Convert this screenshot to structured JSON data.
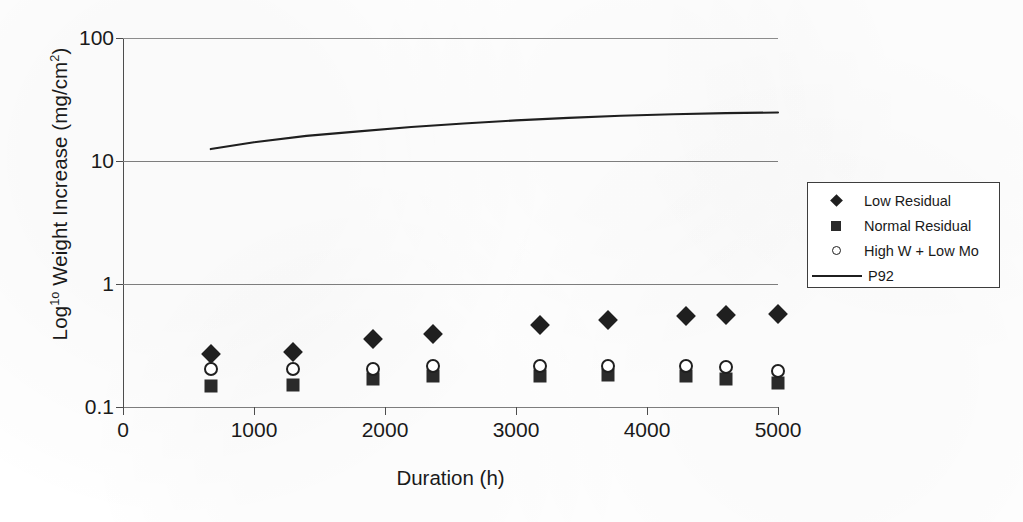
{
  "chart_data": {
    "type": "scatter",
    "title": "",
    "xlabel": "Duration (h)",
    "ylabel": "Log¹° Weight Increase (mg/cm²)",
    "xlim": [
      0,
      5000
    ],
    "ylim": [
      0.1,
      100
    ],
    "yscale": "log",
    "grid": true,
    "legend_position": "right-outside",
    "xticks": [
      "0",
      "1000",
      "2000",
      "3000",
      "4000",
      "5000"
    ],
    "xtick_values": [
      0,
      1000,
      2000,
      3000,
      4000,
      5000
    ],
    "yticks": [
      "0.1",
      "1",
      "10",
      "100"
    ],
    "ytick_values": [
      0.1,
      1,
      10,
      100
    ],
    "series": [
      {
        "name": "Low Residual",
        "marker": "filled-diamond",
        "color": "#1f1f1f",
        "x": [
          670,
          1300,
          1910,
          2370,
          3180,
          3700,
          4300,
          4600,
          5000
        ],
        "y": [
          0.27,
          0.28,
          0.36,
          0.39,
          0.46,
          0.51,
          0.55,
          0.56,
          0.57
        ]
      },
      {
        "name": "Normal Residual",
        "marker": "filled-square",
        "color": "#2a2a2a",
        "x": [
          670,
          1300,
          1910,
          2370,
          3180,
          3700,
          4300,
          4600,
          5000
        ],
        "y": [
          0.148,
          0.152,
          0.168,
          0.178,
          0.178,
          0.182,
          0.178,
          0.168,
          0.158
        ]
      },
      {
        "name": "High W + Low Mo",
        "marker": "open-circle",
        "color": "#1f1f1f",
        "x": [
          670,
          1300,
          1910,
          2370,
          3180,
          3700,
          4300,
          4600,
          5000
        ],
        "y": [
          0.205,
          0.205,
          0.205,
          0.215,
          0.215,
          0.215,
          0.215,
          0.21,
          0.195
        ]
      },
      {
        "name": "P92",
        "marker": "line",
        "color": "#1f1f1f",
        "x": [
          670,
          1000,
          1400,
          1800,
          2200,
          2600,
          3000,
          3400,
          3800,
          4200,
          4600,
          5000
        ],
        "y": [
          12.5,
          14.2,
          16.0,
          17.4,
          18.9,
          20.2,
          21.4,
          22.4,
          23.3,
          24.0,
          24.5,
          24.8
        ]
      }
    ]
  },
  "legend": {
    "items": [
      {
        "label": "Low Residual",
        "marker": "filled-diamond"
      },
      {
        "label": "Normal Residual",
        "marker": "filled-square"
      },
      {
        "label": "High W + Low Mo",
        "marker": "open-circle"
      },
      {
        "label": "P92",
        "marker": "line"
      }
    ]
  },
  "colors": {
    "marker": "#1f1f1f",
    "axis": "#4d4d4d",
    "grid": "#7d7d7d",
    "background": "#ffffff"
  }
}
